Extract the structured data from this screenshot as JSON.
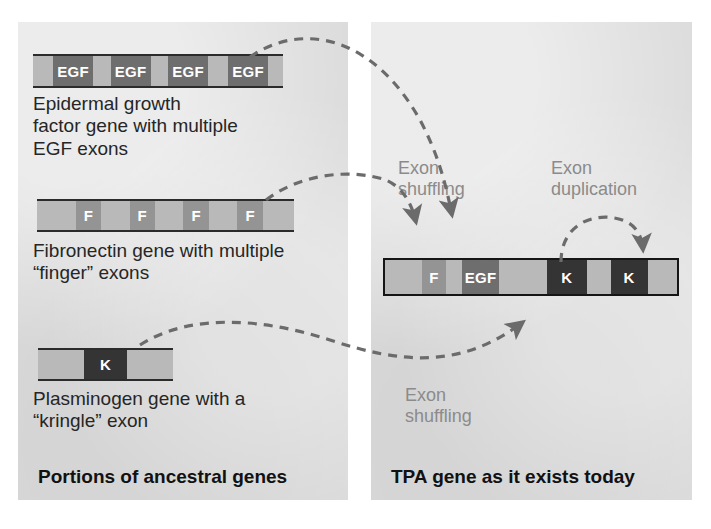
{
  "figure": {
    "colors": {
      "panel_background": "#dcdcdc",
      "page_background": "#ffffff",
      "intron": "#b9b9b9",
      "exon_egf": "#6e6e6e",
      "exon_f": "#949494",
      "exon_k": "#343434",
      "caption_text": "#262626",
      "annotation_text": "#8b8b8b",
      "bar_outline": "#2b2b2b",
      "arrow": "#6b6b6b"
    }
  },
  "left_panel": {
    "label": "Portions of ancestral genes",
    "genes": [
      {
        "name": "egf-gene",
        "caption": "Epidermal growth\nfactor gene with multiple\nEGF exons",
        "segments": [
          {
            "type": "intron",
            "label": "",
            "width": 8
          },
          {
            "type": "exon-egf",
            "label": "EGF",
            "width": 16
          },
          {
            "type": "intron",
            "label": "",
            "width": 7
          },
          {
            "type": "exon-egf",
            "label": "EGF",
            "width": 16
          },
          {
            "type": "intron",
            "label": "",
            "width": 7
          },
          {
            "type": "exon-egf",
            "label": "EGF",
            "width": 16
          },
          {
            "type": "intron",
            "label": "",
            "width": 8
          },
          {
            "type": "exon-egf",
            "label": "EGF",
            "width": 16
          },
          {
            "type": "intron",
            "label": "",
            "width": 6
          }
        ]
      },
      {
        "name": "fibronectin-gene",
        "caption": "Fibronectin gene with multiple\n“finger” exons",
        "segments": [
          {
            "type": "intron",
            "label": "",
            "width": 15
          },
          {
            "type": "exon-f",
            "label": "F",
            "width": 10
          },
          {
            "type": "intron",
            "label": "",
            "width": 11
          },
          {
            "type": "exon-f",
            "label": "F",
            "width": 10
          },
          {
            "type": "intron",
            "label": "",
            "width": 11
          },
          {
            "type": "exon-f",
            "label": "F",
            "width": 10
          },
          {
            "type": "intron",
            "label": "",
            "width": 11
          },
          {
            "type": "exon-f",
            "label": "F",
            "width": 10
          },
          {
            "type": "intron",
            "label": "",
            "width": 12
          }
        ]
      },
      {
        "name": "plasminogen-gene",
        "caption": "Plasminogen gene with a\n“kringle” exon",
        "segments": [
          {
            "type": "intron",
            "label": "",
            "width": 34
          },
          {
            "type": "exon-k",
            "label": "K",
            "width": 32
          },
          {
            "type": "intron",
            "label": "",
            "width": 34
          }
        ]
      }
    ]
  },
  "right_panel": {
    "label": "TPA gene as it exists today",
    "gene": {
      "name": "tpa-gene",
      "segments": [
        {
          "type": "intron",
          "label": "",
          "width": 14
        },
        {
          "type": "exon-f",
          "label": "F",
          "width": 9
        },
        {
          "type": "intron",
          "label": "",
          "width": 6
        },
        {
          "type": "exon-egf",
          "label": "EGF",
          "width": 14
        },
        {
          "type": "intron",
          "label": "",
          "width": 18
        },
        {
          "type": "exon-k",
          "label": "K",
          "width": 15
        },
        {
          "type": "intron",
          "label": "",
          "width": 9
        },
        {
          "type": "exon-k",
          "label": "K",
          "width": 14
        },
        {
          "type": "intron",
          "label": "",
          "width": 11
        }
      ]
    },
    "annotations": [
      {
        "name": "exon-shuffling-top",
        "text": "Exon\nshuffling"
      },
      {
        "name": "exon-duplication",
        "text": "Exon\nduplication"
      },
      {
        "name": "exon-shuffling-bottom",
        "text": "Exon\nshuffling"
      }
    ]
  }
}
